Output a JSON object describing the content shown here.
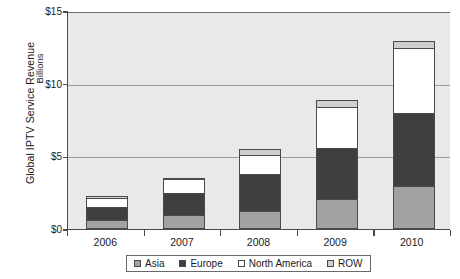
{
  "chart_data": {
    "type": "bar",
    "stacked": true,
    "title": "",
    "xlabel": "",
    "ylabel": "Global IPTV Service Revenue",
    "ylabel_secondary": "Billions",
    "categories": [
      "2006",
      "2007",
      "2008",
      "2009",
      "2010"
    ],
    "ytick_labels": [
      "$0",
      "$5",
      "$10",
      "$15"
    ],
    "ytick_values": [
      0,
      5,
      10,
      15
    ],
    "ylim": [
      0,
      15
    ],
    "grid": true,
    "legend_position": "bottom",
    "series": [
      {
        "name": "Asia",
        "color": "#a2a2a2",
        "values": [
          0.5,
          0.8,
          1.1,
          1.9,
          2.8
        ]
      },
      {
        "name": "Europe",
        "color": "#3f3f3f",
        "values": [
          0.8,
          1.45,
          2.45,
          3.5,
          5.0
        ]
      },
      {
        "name": "North America",
        "color": "#ffffff",
        "values": [
          0.55,
          0.9,
          1.3,
          2.75,
          4.4
        ]
      },
      {
        "name": "ROW",
        "color": "#cfcfcf",
        "values": [
          0.05,
          0.05,
          0.3,
          0.4,
          0.4
        ]
      }
    ],
    "totals": [
      1.9,
      3.2,
      5.15,
      8.55,
      12.6
    ]
  },
  "colors": {
    "plot_background": "#e9e9e9",
    "gridline": "#9a9a9a",
    "axis": "#4a4a4a",
    "text": "#1a1a1a",
    "page_background": "#ffffff"
  }
}
